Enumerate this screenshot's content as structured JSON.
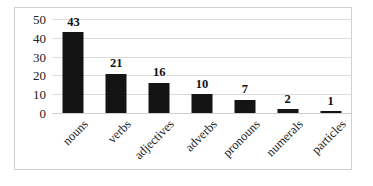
{
  "chart_data": {
    "type": "bar",
    "title": "",
    "subtitle": "",
    "xlabel": "",
    "ylabel": "",
    "categories": [
      "nouns",
      "verbs",
      "adjectives",
      "adverbs",
      "pronouns",
      "numerals",
      "particles"
    ],
    "values": [
      43,
      21,
      16,
      10,
      7,
      2,
      1
    ],
    "data_labels": [
      "43",
      "21",
      "16",
      "10",
      "7",
      "2",
      "1"
    ],
    "yticks": [
      50,
      40,
      30,
      20,
      10,
      0
    ],
    "ytick_labels": [
      "50",
      "40",
      "30",
      "20",
      "10",
      "0"
    ],
    "ylim": [
      0,
      50
    ],
    "grid": true,
    "grid_axis": "y",
    "legend": false,
    "legend_position": "none",
    "bar_color": "#141414",
    "grid_color": "#dcdcdc",
    "border_color": "#d0d0d0",
    "background_color": "#ffffff",
    "label_rotation": -45
  }
}
